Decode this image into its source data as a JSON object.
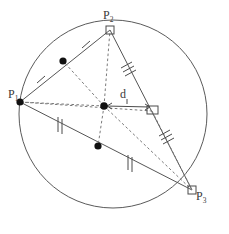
{
  "figure": {
    "stroke_color": "#555555",
    "dash_color": "#777777",
    "point_color": "#111111",
    "label_color": "#3a3a3a",
    "background": "#ffffff"
  },
  "circle": {
    "name": "circumcircle",
    "cx": 113,
    "cy": 114,
    "r": 94
  },
  "vertices": [
    {
      "id": "P1",
      "label": "P",
      "sub": "1",
      "x": 20,
      "y": 102,
      "label_x": 8,
      "label_y": 88,
      "marker": "dot"
    },
    {
      "id": "P2",
      "label": "P",
      "sub": "2",
      "x": 110,
      "y": 30,
      "label_x": 103,
      "label_y": 9,
      "marker": "square"
    },
    {
      "id": "P3",
      "label": "P",
      "sub": "3",
      "x": 192,
      "y": 190,
      "label_x": 196,
      "label_y": 190,
      "marker": "square"
    }
  ],
  "circumcenter": {
    "name": "circumcenter",
    "x": 104,
    "y": 106,
    "marker": "dot"
  },
  "midpoints": [
    {
      "name": "midpoint-P1-P2",
      "x": 63,
      "y": 61,
      "marker": "dot"
    },
    {
      "name": "midpoint-P1-P3",
      "x": 98,
      "y": 146,
      "marker": "dot"
    }
  ],
  "foot": {
    "name": "foot-of-perpendicular-on-P2P3",
    "x": 152,
    "y": 111,
    "marker": "square"
  },
  "sides": [
    {
      "name": "side-P1-P2",
      "from": "P1",
      "to": "P2",
      "ticks": 1
    },
    {
      "name": "side-P2-P3",
      "from": "P2",
      "to": "P3",
      "ticks": 3
    },
    {
      "name": "side-P1-P3",
      "from": "P1",
      "to": "P3",
      "ticks": 2
    }
  ],
  "tick_marks": [
    {
      "name": "tick-P1-mid12",
      "count": 1,
      "x": 41,
      "y": 82
    },
    {
      "name": "tick-mid12-P2",
      "count": 1,
      "x": 86,
      "y": 46
    },
    {
      "name": "tick-P2-mid23",
      "count": 3,
      "x": 127,
      "y": 66
    },
    {
      "name": "tick-mid23-P3",
      "count": 3,
      "x": 165,
      "y": 138
    },
    {
      "name": "tick-P1-mid13",
      "count": 2,
      "x": 60,
      "y": 125
    },
    {
      "name": "tick-mid13-P3",
      "count": 2,
      "x": 130,
      "y": 163
    }
  ],
  "dashed_segments": [
    {
      "name": "radius-center-to-P1",
      "from": "circumcenter",
      "to": "P1"
    },
    {
      "name": "radius-center-to-P2",
      "from": "circumcenter",
      "to": "P2"
    },
    {
      "name": "radius-center-to-P3",
      "from": "circumcenter",
      "to": "P3"
    },
    {
      "name": "center-to-midpoint-P1P2",
      "from": "circumcenter",
      "to": "midpoint-P1-P2"
    },
    {
      "name": "center-to-midpoint-P1P3",
      "from": "circumcenter",
      "to": "midpoint-P1-P3"
    },
    {
      "name": "P1-to-foot",
      "from": "P1",
      "to": "foot"
    }
  ],
  "distance_measure": {
    "name": "distance-d",
    "label": "d",
    "from": {
      "x": 104,
      "y": 106
    },
    "to": {
      "x": 152,
      "y": 107
    },
    "label_x": 120,
    "label_y": 88,
    "arrow": "double-headed"
  },
  "right_angles": [
    {
      "name": "right-angle-at-foot",
      "x": 152,
      "y": 111
    },
    {
      "name": "right-angle-at-P2",
      "x": 110,
      "y": 30
    },
    {
      "name": "right-angle-at-P3",
      "x": 192,
      "y": 190
    }
  ]
}
